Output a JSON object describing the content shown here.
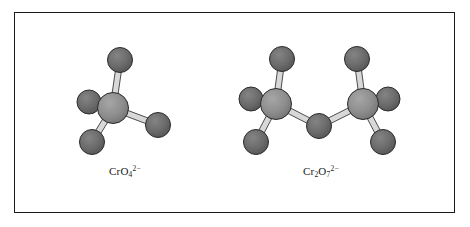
{
  "figure": {
    "kind": "ball-and-stick-molecular-models",
    "frame": {
      "x": 14,
      "y": 12,
      "width": 441,
      "height": 201,
      "border_color": "#1a1a1a",
      "background": "#ffffff"
    },
    "palette": {
      "chromium_fill": "#8e8e8e",
      "chromium_shade": "#6f6f6f",
      "oxygen_fill": "#6b6b6b",
      "oxygen_shade": "#545454",
      "atom_outline": "#2b2b2b",
      "bond_fill": "#d8d8d8",
      "bond_outline": "#3a3a3a",
      "label_color": "#1a1a1a"
    },
    "bond": {
      "half_width": 3.0,
      "outline_width": 0.9
    }
  },
  "molecules": [
    {
      "id": "chromate",
      "name": "chromate ion",
      "label": {
        "formula_prefix": "CrO",
        "oxygen_count": "4",
        "charge": "2−",
        "plain": "CrO4 2-"
      },
      "label_position": {
        "x": 109,
        "y": 165
      },
      "atoms": [
        {
          "id": "cr1",
          "element": "Cr",
          "x": 113,
          "y": 108,
          "r": 15.5,
          "z": 3
        },
        {
          "id": "o-top",
          "element": "O",
          "x": 120,
          "y": 60,
          "r": 12.5,
          "z": 1
        },
        {
          "id": "o-left",
          "element": "O",
          "x": 89,
          "y": 102,
          "r": 12.0,
          "z": 1
        },
        {
          "id": "o-lower-left",
          "element": "O",
          "x": 92,
          "y": 142,
          "r": 12.5,
          "z": 1
        },
        {
          "id": "o-right",
          "element": "O",
          "x": 158,
          "y": 125,
          "r": 12.5,
          "z": 1
        }
      ],
      "bonds": [
        {
          "from": "cr1",
          "to": "o-top"
        },
        {
          "from": "cr1",
          "to": "o-left"
        },
        {
          "from": "cr1",
          "to": "o-lower-left"
        },
        {
          "from": "cr1",
          "to": "o-right"
        }
      ]
    },
    {
      "id": "dichromate",
      "name": "dichromate ion",
      "label": {
        "formula_prefix": "Cr",
        "chromium_count": "2",
        "formula_mid": "O",
        "oxygen_count": "7",
        "charge": "2−",
        "plain": "Cr2O7 2-"
      },
      "label_position": {
        "x": 303,
        "y": 165
      },
      "atoms": [
        {
          "id": "crL",
          "element": "Cr",
          "x": 276,
          "y": 104,
          "r": 15.5,
          "z": 3
        },
        {
          "id": "crR",
          "element": "Cr",
          "x": 363,
          "y": 104,
          "r": 15.5,
          "z": 3
        },
        {
          "id": "o-bridge",
          "element": "O",
          "x": 319,
          "y": 126,
          "r": 12.5,
          "z": 2
        },
        {
          "id": "oL-top",
          "element": "O",
          "x": 282,
          "y": 59,
          "r": 12.5,
          "z": 1
        },
        {
          "id": "oL-left",
          "element": "O",
          "x": 251,
          "y": 99,
          "r": 12.0,
          "z": 1
        },
        {
          "id": "oL-lower",
          "element": "O",
          "x": 256,
          "y": 142,
          "r": 12.5,
          "z": 1
        },
        {
          "id": "oR-top",
          "element": "O",
          "x": 357,
          "y": 59,
          "r": 12.5,
          "z": 1
        },
        {
          "id": "oR-right",
          "element": "O",
          "x": 388,
          "y": 99,
          "r": 12.0,
          "z": 1
        },
        {
          "id": "oR-lower",
          "element": "O",
          "x": 383,
          "y": 142,
          "r": 12.5,
          "z": 1
        }
      ],
      "bonds": [
        {
          "from": "crL",
          "to": "oL-top"
        },
        {
          "from": "crL",
          "to": "oL-left"
        },
        {
          "from": "crL",
          "to": "oL-lower"
        },
        {
          "from": "crL",
          "to": "o-bridge"
        },
        {
          "from": "crR",
          "to": "o-bridge"
        },
        {
          "from": "crR",
          "to": "oR-top"
        },
        {
          "from": "crR",
          "to": "oR-right"
        },
        {
          "from": "crR",
          "to": "oR-lower"
        }
      ]
    }
  ]
}
